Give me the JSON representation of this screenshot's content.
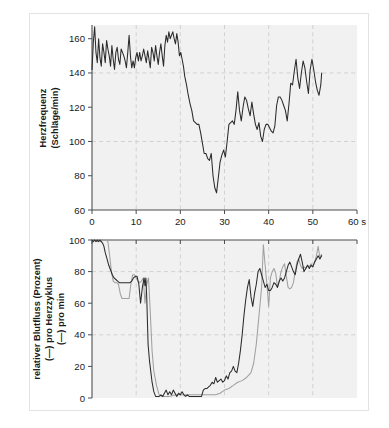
{
  "figure": {
    "background_color": "#ffffff",
    "frame_color": "#e3e3e3",
    "plot_background_color": "#f1f1f1",
    "grid_color": "#c9c9c9"
  },
  "chart_data": [
    {
      "type": "line",
      "panel": "top",
      "title": "",
      "xlabel": "",
      "ylabel": "Herzfrequenz (Schläge/min)",
      "ylabel_lines": [
        "Herzfrequenz",
        "(Schläge/min)"
      ],
      "xlim": [
        0,
        60
      ],
      "ylim": [
        60,
        168
      ],
      "xticks": [
        0,
        10,
        20,
        30,
        40,
        50,
        60
      ],
      "xticklabels": [
        "0",
        "10",
        "20",
        "30",
        "40",
        "50",
        "60 s"
      ],
      "yticks": [
        60,
        80,
        100,
        120,
        140,
        160
      ],
      "yticklabels": [
        "60",
        "80",
        "100",
        "120",
        "140",
        "160"
      ],
      "grid": true,
      "grid_x_values": [
        10,
        20,
        30,
        40,
        50
      ],
      "grid_y_values": [
        100,
        140
      ],
      "legend": "none",
      "series": [
        {
          "name": "Herzfrequenz",
          "color": "#2b2b2b",
          "x": [
            0.0,
            0.3,
            0.6,
            0.9,
            1.2,
            1.5,
            1.8,
            2.1,
            2.4,
            2.7,
            3.0,
            3.3,
            3.6,
            3.9,
            4.2,
            4.5,
            4.8,
            5.1,
            5.4,
            5.7,
            6.0,
            6.3,
            6.6,
            6.9,
            7.2,
            7.5,
            7.8,
            8.1,
            8.4,
            8.7,
            9.0,
            9.3,
            9.6,
            9.9,
            10.2,
            10.5,
            10.8,
            11.1,
            11.4,
            11.7,
            12.0,
            12.3,
            12.6,
            12.9,
            13.2,
            13.5,
            13.8,
            14.1,
            14.4,
            14.7,
            15.0,
            15.3,
            15.6,
            15.9,
            16.2,
            16.5,
            16.8,
            17.1,
            17.4,
            17.7,
            18.0,
            18.3,
            18.6,
            18.9,
            19.2,
            19.5,
            19.8,
            20.1,
            20.4,
            20.7,
            21.0,
            21.4,
            21.8,
            22.2,
            22.6,
            23.0,
            23.4,
            23.8,
            24.2,
            24.6,
            25.0,
            25.4,
            25.8,
            26.2,
            26.6,
            27.0,
            27.4,
            27.8,
            28.2,
            28.6,
            29.0,
            29.4,
            29.8,
            30.2,
            30.6,
            31.0,
            31.4,
            31.8,
            32.2,
            32.6,
            33.0,
            33.4,
            33.8,
            34.2,
            34.6,
            35.0,
            35.4,
            35.8,
            36.2,
            36.6,
            37.0,
            37.4,
            37.8,
            38.2,
            38.6,
            39.0,
            39.4,
            39.8,
            40.2,
            40.6,
            41.0,
            41.4,
            41.8,
            42.2,
            42.6,
            43.0,
            43.4,
            43.8,
            44.2,
            44.6,
            45.0,
            45.4,
            45.8,
            46.2,
            46.6,
            47.0,
            47.4,
            47.8,
            48.2,
            48.6,
            49.0,
            49.4,
            49.8,
            50.2,
            50.6,
            51.0,
            51.4,
            51.8,
            52.0
          ],
          "y": [
            142,
            158,
            167,
            152,
            146,
            160,
            149,
            144,
            157,
            152,
            146,
            159,
            154,
            150,
            144,
            156,
            148,
            142,
            152,
            155,
            148,
            145,
            154,
            152,
            150,
            147,
            143,
            152,
            162,
            150,
            143,
            147,
            143,
            149,
            152,
            147,
            152,
            147,
            150,
            154,
            150,
            146,
            153,
            148,
            143,
            155,
            152,
            147,
            156,
            150,
            145,
            152,
            157,
            150,
            144,
            156,
            162,
            158,
            164,
            160,
            162,
            164,
            160,
            157,
            163,
            158,
            150,
            152,
            148,
            144,
            138,
            133,
            127,
            122,
            118,
            112,
            111,
            110,
            110,
            105,
            99,
            93,
            93,
            90,
            89,
            93,
            80,
            73,
            70,
            79,
            88,
            92,
            95,
            91,
            100,
            110,
            111,
            112,
            110,
            118,
            129,
            118,
            112,
            120,
            126,
            124,
            119,
            115,
            123,
            116,
            110,
            107,
            111,
            103,
            100,
            107,
            110,
            110,
            108,
            106,
            105,
            109,
            121,
            126,
            126,
            124,
            121,
            118,
            112,
            122,
            134,
            133,
            141,
            148,
            137,
            131,
            140,
            147,
            143,
            135,
            128,
            142,
            148,
            142,
            135,
            130,
            127,
            133,
            140
          ]
        }
      ]
    },
    {
      "type": "line",
      "panel": "bottom",
      "title": "",
      "xlabel": "",
      "ylabel": "relativer Blutfluss (Prozent) (—) pro Herzzyklus (—) pro min",
      "ylabel_lines": [
        "relativer Blutfluss (Prozent)",
        "(—) pro Herzzyklus",
        "(—) pro min"
      ],
      "xlim": [
        0,
        60
      ],
      "ylim": [
        0,
        100
      ],
      "xticks": [
        0,
        10,
        20,
        30,
        40,
        50,
        60
      ],
      "xticklabels": [
        "",
        "",
        "",
        "",
        "",
        "",
        ""
      ],
      "yticks": [
        0,
        20,
        40,
        60,
        80,
        100
      ],
      "yticklabels": [
        "0",
        "20",
        "40",
        "60",
        "80",
        "100"
      ],
      "grid": true,
      "grid_x_values": [
        10,
        20,
        30,
        40,
        50
      ],
      "grid_y_values": [
        40,
        80
      ],
      "legend": "none",
      "series": [
        {
          "name": "pro min",
          "color": "#a0a0a0",
          "x": [
            0.0,
            0.4,
            0.8,
            1.2,
            1.6,
            2.0,
            2.4,
            2.8,
            3.2,
            3.6,
            4.0,
            4.4,
            4.8,
            5.2,
            5.6,
            6.0,
            6.4,
            6.8,
            7.2,
            7.6,
            8.0,
            8.4,
            8.8,
            9.2,
            9.6,
            10.0,
            10.4,
            10.8,
            11.2,
            11.6,
            12.0,
            12.4,
            12.8,
            13.2,
            13.6,
            14.0,
            14.6,
            15.2,
            15.8,
            16.5,
            17.5,
            19.0,
            21.0,
            23.0,
            25.0,
            26.0,
            27.0,
            28.0,
            29.0,
            30.0,
            31.0,
            32.0,
            33.0,
            34.0,
            35.0,
            36.0,
            36.6,
            37.2,
            37.8,
            38.4,
            38.8,
            39.2,
            39.6,
            40.0,
            40.4,
            40.8,
            41.2,
            41.6,
            42.0,
            42.4,
            42.8,
            43.2,
            43.6,
            44.0,
            44.4,
            44.8,
            45.2,
            45.6,
            46.0,
            46.4,
            46.8,
            47.2,
            47.6,
            48.0,
            48.4,
            48.8,
            49.2,
            49.6,
            50.0,
            50.4,
            50.8,
            51.2,
            51.6,
            52.0
          ],
          "y": [
            100,
            100,
            100,
            99,
            100,
            99,
            100,
            100,
            100,
            99,
            90,
            80,
            74,
            73,
            73,
            72,
            66,
            63,
            63,
            63,
            63,
            63,
            72,
            78,
            78,
            76,
            74,
            73,
            74,
            76,
            60,
            72,
            76,
            54,
            30,
            17,
            8,
            2,
            1,
            1,
            1,
            2,
            2,
            2,
            2,
            2,
            2,
            2,
            3,
            5,
            6,
            8,
            10,
            11,
            13,
            16,
            22,
            34,
            52,
            70,
            97,
            84,
            72,
            58,
            76,
            80,
            82,
            79,
            70,
            74,
            80,
            83,
            85,
            77,
            70,
            69,
            70,
            73,
            80,
            86,
            88,
            84,
            82,
            83,
            82,
            84,
            83,
            85,
            83,
            86,
            90,
            96,
            89,
            91
          ]
        },
        {
          "name": "pro Herzzyklus",
          "color": "#2b2b2b",
          "x": [
            0.0,
            0.3,
            0.6,
            0.9,
            1.2,
            1.5,
            1.8,
            2.1,
            2.4,
            2.7,
            3.0,
            3.4,
            3.8,
            4.2,
            4.6,
            5.0,
            5.4,
            5.8,
            6.2,
            6.6,
            7.0,
            7.4,
            7.8,
            8.2,
            8.6,
            9.0,
            9.4,
            9.8,
            10.2,
            10.6,
            11.0,
            11.4,
            11.8,
            12.0,
            12.2,
            12.4,
            12.7,
            13.0,
            13.3,
            13.6,
            14.0,
            14.4,
            14.8,
            15.2,
            15.6,
            16.0,
            16.4,
            16.8,
            17.2,
            17.6,
            18.0,
            18.4,
            18.8,
            19.2,
            19.6,
            20.0,
            20.4,
            20.8,
            21.2,
            21.6,
            22.0,
            22.4,
            22.8,
            23.2,
            23.6,
            24.0,
            24.4,
            24.8,
            25.2,
            25.6,
            26.0,
            26.4,
            26.8,
            27.2,
            27.6,
            28.0,
            28.4,
            28.8,
            29.2,
            29.6,
            30.0,
            30.4,
            30.8,
            31.2,
            31.6,
            32.0,
            32.4,
            32.8,
            33.2,
            33.6,
            34.0,
            34.4,
            34.8,
            35.2,
            35.6,
            36.0,
            36.4,
            36.8,
            37.2,
            37.6,
            38.0,
            38.4,
            38.8,
            39.2,
            39.6,
            40.0,
            40.4,
            40.8,
            41.2,
            41.6,
            42.0,
            42.4,
            42.8,
            43.2,
            43.6,
            44.0,
            44.4,
            44.8,
            45.2,
            45.6,
            46.0,
            46.4,
            46.8,
            47.2,
            47.6,
            48.0,
            48.4,
            48.8,
            49.2,
            49.6,
            50.0,
            50.4,
            50.8,
            51.2,
            51.6,
            52.0
          ],
          "y": [
            100,
            99,
            100,
            99,
            100,
            99,
            100,
            99,
            98,
            96,
            92,
            88,
            84,
            81,
            78,
            76,
            75,
            74,
            73,
            73,
            73,
            73,
            73,
            73,
            73,
            74,
            76,
            77,
            77,
            72,
            60,
            70,
            76,
            71,
            76,
            63,
            34,
            24,
            17,
            10,
            4,
            1,
            1,
            1,
            2,
            1,
            3,
            5,
            2,
            4,
            2,
            5,
            3,
            1,
            3,
            2,
            4,
            2,
            1,
            2,
            1,
            1,
            1,
            1,
            1,
            1,
            1,
            1,
            5,
            6,
            6,
            7,
            8,
            10,
            9,
            13,
            10,
            11,
            12,
            10,
            11,
            14,
            12,
            16,
            17,
            20,
            17,
            16,
            22,
            30,
            40,
            52,
            62,
            70,
            75,
            64,
            58,
            66,
            72,
            80,
            82,
            78,
            74,
            70,
            72,
            68,
            68,
            70,
            73,
            72,
            70,
            74,
            76,
            74,
            76,
            80,
            84,
            86,
            83,
            80,
            78,
            84,
            88,
            91,
            86,
            80,
            82,
            84,
            82,
            84,
            83,
            86,
            88,
            90,
            88,
            90
          ]
        }
      ]
    }
  ]
}
